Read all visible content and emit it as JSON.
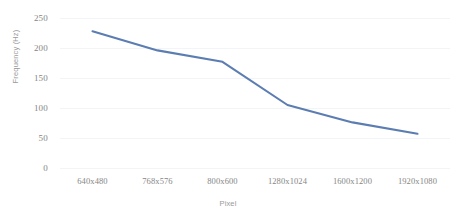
{
  "chart_data": {
    "type": "line",
    "title": "",
    "subtitle": "",
    "xlabel": "Pixel",
    "ylabel": "Frequency (Hz)",
    "categories": [
      "640x480",
      "768x576",
      "800x600",
      "1280x1024",
      "1600x1200",
      "1920x1080"
    ],
    "series": [
      {
        "name": "Frequency",
        "values": [
          228,
          196,
          177,
          105,
          76,
          57
        ],
        "color": "#5B7DB1"
      }
    ],
    "ylim": [
      0,
      250
    ],
    "yticks": [
      250,
      200,
      150,
      100,
      50,
      0
    ],
    "ytick_labels": [
      "250",
      "200",
      "150",
      "100",
      "50",
      "0"
    ],
    "grid": true,
    "grid_color": "#f2f4f8",
    "legend": "none",
    "legend_position": "none",
    "background": "#ffffff",
    "axis_label_color": "#868686",
    "axis_title_color": "#9a9a9a"
  },
  "axes": {
    "y_title": "Frequency (Hz)",
    "x_title": "Pixel"
  }
}
